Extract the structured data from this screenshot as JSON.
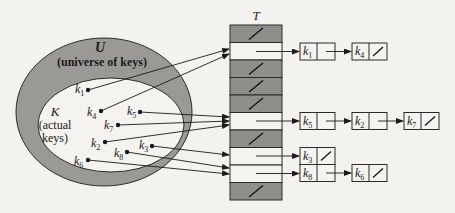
{
  "diagram": {
    "type": "hash-table-chaining",
    "colors": {
      "background": "#f3f2ee",
      "universe_fill": "#9a9995",
      "keys_fill": "#f4f3ef",
      "empty_slot_fill": "#8f8e8a",
      "occupied_slot_fill": "#f4f3ef",
      "stroke": "#2a2a2a"
    },
    "universe": {
      "label": "U",
      "caption": "(universe of keys)"
    },
    "actual_keys": {
      "label": "K",
      "caption_line1": "(actual",
      "caption_line2": "keys)"
    },
    "keys": [
      {
        "id": "k1",
        "base": "k",
        "sub": "1"
      },
      {
        "id": "k2",
        "base": "k",
        "sub": "2"
      },
      {
        "id": "k3",
        "base": "k",
        "sub": "3"
      },
      {
        "id": "k4",
        "base": "k",
        "sub": "4"
      },
      {
        "id": "k5",
        "base": "k",
        "sub": "5"
      },
      {
        "id": "k6",
        "base": "k",
        "sub": "6"
      },
      {
        "id": "k7",
        "base": "k",
        "sub": "7"
      },
      {
        "id": "k8",
        "base": "k",
        "sub": "8"
      }
    ],
    "table": {
      "label": "T",
      "slots": [
        {
          "index": 0,
          "state": "nil"
        },
        {
          "index": 1,
          "state": "chain",
          "chain": [
            "k1",
            "k4"
          ]
        },
        {
          "index": 2,
          "state": "nil"
        },
        {
          "index": 3,
          "state": "nil"
        },
        {
          "index": 4,
          "state": "nil"
        },
        {
          "index": 5,
          "state": "chain",
          "chain": [
            "k5",
            "k2",
            "k7"
          ]
        },
        {
          "index": 6,
          "state": "nil"
        },
        {
          "index": 7,
          "state": "chain",
          "chain": [
            "k3"
          ]
        },
        {
          "index": 8,
          "state": "chain",
          "chain": [
            "k8",
            "k6"
          ]
        },
        {
          "index": 9,
          "state": "nil"
        }
      ]
    },
    "chains": {
      "slot1": [
        {
          "base": "k",
          "sub": "1"
        },
        {
          "base": "k",
          "sub": "4"
        }
      ],
      "slot5": [
        {
          "base": "k",
          "sub": "5"
        },
        {
          "base": "k",
          "sub": "2"
        },
        {
          "base": "k",
          "sub": "7"
        }
      ],
      "slot7": [
        {
          "base": "k",
          "sub": "3"
        }
      ],
      "slot8": [
        {
          "base": "k",
          "sub": "8"
        },
        {
          "base": "k",
          "sub": "6"
        }
      ]
    },
    "nil_symbol": "/"
  }
}
